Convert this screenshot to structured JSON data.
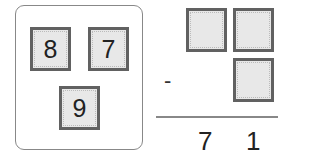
{
  "cards": [
    {
      "value": "8"
    },
    {
      "value": "7"
    },
    {
      "value": "9"
    }
  ],
  "problem": {
    "operator": "-",
    "top_row": [
      "",
      ""
    ],
    "bottom_row": [
      ""
    ],
    "result": [
      "7",
      "1"
    ]
  }
}
